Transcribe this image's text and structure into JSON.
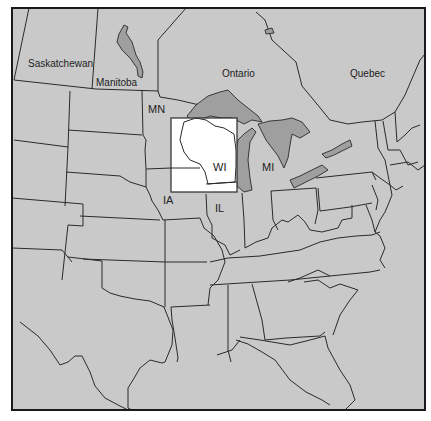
{
  "map": {
    "colors": {
      "land": "#c9c9c9",
      "lakes": "#9f9f9f",
      "highlight": "#ffffff",
      "borders": "#2a2a2a",
      "background": "#ffffff"
    },
    "highlight_box": {
      "region": "WI",
      "x": 171,
      "y": 118,
      "width": 66,
      "height": 74
    },
    "labels": {
      "saskatchewan": "Saskatchewan",
      "manitoba": "Manitoba",
      "ontario": "Ontario",
      "quebec": "Quebec",
      "mn": "MN",
      "wi": "WI",
      "mi": "MI",
      "ia": "IA",
      "il": "IL"
    }
  }
}
